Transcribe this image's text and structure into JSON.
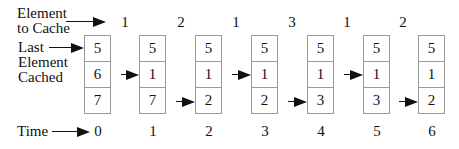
{
  "labels": {
    "element_to_cache_line1": "Element",
    "element_to_cache_line2": "to Cache",
    "last_cached_line1": "Last",
    "last_cached_line2": "Element",
    "last_cached_line3": "Cached",
    "time": "Time"
  },
  "elements_to_cache": [
    "1",
    "2",
    "1",
    "3",
    "1",
    "2"
  ],
  "times": [
    "0",
    "1",
    "2",
    "3",
    "4",
    "5",
    "6"
  ],
  "cache_states": [
    {
      "cells": [
        "5",
        "6",
        "7"
      ],
      "pointer_row": 0
    },
    {
      "cells": [
        "5",
        "1",
        "7"
      ],
      "pointer_row": 1
    },
    {
      "cells": [
        "5",
        "1",
        "2"
      ],
      "pointer_row": 2
    },
    {
      "cells": [
        "5",
        "1",
        "2"
      ],
      "pointer_row": 1
    },
    {
      "cells": [
        "5",
        "1",
        "3"
      ],
      "pointer_row": 2
    },
    {
      "cells": [
        "5",
        "1",
        "3"
      ],
      "pointer_row": 1
    },
    {
      "cells": [
        "5",
        "1",
        "2"
      ],
      "pointer_row": 2
    }
  ]
}
